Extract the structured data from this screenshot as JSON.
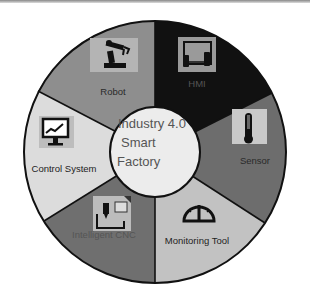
{
  "diagram": {
    "center": {
      "lines": [
        "Industry 4.0",
        "Smart",
        "Factory"
      ],
      "fill": "#ececec"
    },
    "segments": [
      {
        "label": "HMI",
        "icon": "touchscreen-hands-icon",
        "fill": "#111111",
        "label_color": "#555555"
      },
      {
        "label": "Sensor",
        "icon": "thermometer-icon",
        "fill": "#6d6d6d",
        "label_color": "#2a2a2a"
      },
      {
        "label": "Monitoring Tool",
        "icon": "gauge-icon",
        "fill": "#c2c2c2",
        "label_color": "#222222"
      },
      {
        "label": "Intelligent CNC",
        "icon": "cnc-machine-icon",
        "fill": "#6f6f6f",
        "label_color": "#555555"
      },
      {
        "label": "Control System",
        "icon": "monitor-chart-icon",
        "fill": "#dcdcdc",
        "label_color": "#222222"
      },
      {
        "label": "Robot",
        "icon": "robot-arm-icon",
        "fill": "#8e8e8e",
        "label_color": "#2a2a2a"
      }
    ]
  }
}
